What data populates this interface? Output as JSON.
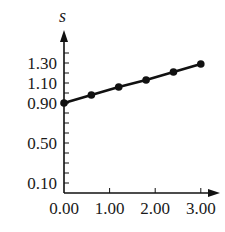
{
  "chart_data": {
    "type": "line",
    "title": "",
    "xlabel": "",
    "ylabel": "s",
    "x": [
      0.0,
      0.6,
      1.2,
      1.8,
      2.4,
      3.0
    ],
    "series": [
      {
        "name": "s",
        "values": [
          0.9,
          0.98,
          1.06,
          1.13,
          1.21,
          1.29
        ],
        "markers": true
      }
    ],
    "xlim": [
      0.0,
      3.3
    ],
    "ylim": [
      0.0,
      1.5
    ],
    "x_ticks": [
      0.0,
      1.0,
      2.0,
      3.0
    ],
    "x_tick_labels": [
      "0.00",
      "1.00",
      "2.00",
      "3.00"
    ],
    "y_ticks_major": [
      0.1,
      0.5,
      0.9,
      1.1,
      1.3
    ],
    "y_tick_labels": [
      "0.10",
      "0.50",
      "0.90",
      "1.10",
      "1.30"
    ],
    "y_minor_tick_step": 0.1,
    "grid": false,
    "legend": null,
    "colors": {
      "line": "#111111",
      "marker": "#111111",
      "axis": "#111111",
      "background": "#ffffff"
    }
  }
}
